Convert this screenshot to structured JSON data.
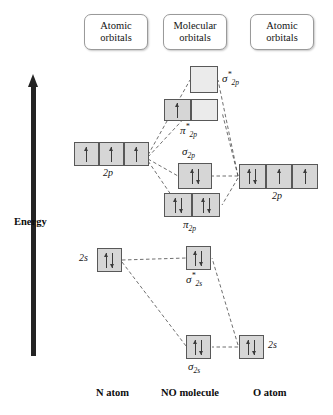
{
  "diagram": {
    "title_present": false,
    "axis": {
      "label": "Energy",
      "direction": "up",
      "color": "#232323"
    },
    "headers": [
      {
        "name": "left-atomic",
        "line1": "Atomic",
        "line2": "orbitals"
      },
      {
        "name": "molecular",
        "line1": "Molecular",
        "line2": "orbitals"
      },
      {
        "name": "right-atomic",
        "line1": "Atomic",
        "line2": "orbitals"
      }
    ],
    "footers": [
      {
        "name": "n-atom",
        "label": "N atom"
      },
      {
        "name": "no-molecule",
        "label": "NO molecule"
      },
      {
        "name": "o-atom",
        "label": "O atom"
      }
    ],
    "colors": {
      "box_fill": "#d6d6d6",
      "box_fill_empty": "#ebebeb",
      "box_border": "#585858",
      "arrow": "#3b3b3b",
      "connector": "#4a4a4a",
      "text": "#141414"
    },
    "orbital_labels": {
      "sigma_star_2p": {
        "base": "σ",
        "sup": "*",
        "sub": "2p"
      },
      "pi_star_2p": {
        "base": "π",
        "sup": "*",
        "sub": "2p"
      },
      "sigma_2p": {
        "base": "σ",
        "sup": "",
        "sub": "2p"
      },
      "pi_2p": {
        "base": "π",
        "sup": "",
        "sub": "2p"
      },
      "sigma_star_2s": {
        "base": "σ",
        "sup": "*",
        "sub": "2s"
      },
      "sigma_2s": {
        "base": "σ",
        "sup": "",
        "sub": "2s"
      },
      "atomic_2p": "2p",
      "atomic_2s": "2s"
    },
    "levels": {
      "n_2p": {
        "owner": "N atom",
        "label": "2p",
        "boxes": [
          "up",
          "up",
          "up"
        ],
        "electron_count": 3
      },
      "n_2s": {
        "owner": "N atom",
        "label": "2s",
        "boxes": [
          "pair"
        ],
        "electron_count": 2
      },
      "o_2p": {
        "owner": "O atom",
        "label": "2p",
        "boxes": [
          "pair",
          "up",
          "up"
        ],
        "electron_count": 4
      },
      "o_2s": {
        "owner": "O atom",
        "label": "2s",
        "boxes": [
          "pair"
        ],
        "electron_count": 2
      },
      "mo_sigma_star_2p": {
        "owner": "NO molecule",
        "boxes": [
          "empty"
        ],
        "electron_count": 0
      },
      "mo_pi_star_2p": {
        "owner": "NO molecule",
        "boxes": [
          "up",
          "empty"
        ],
        "electron_count": 1
      },
      "mo_sigma_2p": {
        "owner": "NO molecule",
        "boxes": [
          "pair"
        ],
        "electron_count": 2
      },
      "mo_pi_2p": {
        "owner": "NO molecule",
        "boxes": [
          "pair",
          "pair"
        ],
        "electron_count": 4
      },
      "mo_sigma_star_2s": {
        "owner": "NO molecule",
        "boxes": [
          "pair"
        ],
        "electron_count": 2
      },
      "mo_sigma_2s": {
        "owner": "NO molecule",
        "boxes": [
          "pair"
        ],
        "electron_count": 2
      }
    }
  }
}
